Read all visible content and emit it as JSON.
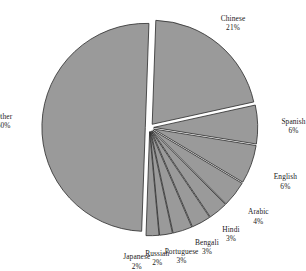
{
  "chart_data": {
    "type": "pie",
    "title": "",
    "subtitle": "",
    "xlabel": "",
    "ylabel": "",
    "legend_position": "none",
    "grid": false,
    "exploded": true,
    "fill_color": "#9a9a9a",
    "outline_color": "#2b2b2b",
    "background_color": "#ffffff",
    "units": "%",
    "categories": [
      "Chinese",
      "Spanish",
      "English",
      "Arabic",
      "Hindi",
      "Bengali",
      "Portuguese",
      "Russian",
      "Japanese",
      "Other"
    ],
    "values": [
      21,
      6,
      6,
      4,
      3,
      3,
      3,
      2,
      2,
      50
    ],
    "slices": [
      {
        "label": "Chinese",
        "value": 21,
        "value_text": "21%"
      },
      {
        "label": "Spanish",
        "value": 6,
        "value_text": "6%"
      },
      {
        "label": "English",
        "value": 6,
        "value_text": "6%"
      },
      {
        "label": "Arabic",
        "value": 4,
        "value_text": "4%"
      },
      {
        "label": "Hindi",
        "value": 3,
        "value_text": "3%"
      },
      {
        "label": "Bengali",
        "value": 3,
        "value_text": "3%"
      },
      {
        "label": "Portuguese",
        "value": 3,
        "value_text": "3%"
      },
      {
        "label": "Russian",
        "value": 2,
        "value_text": "2%"
      },
      {
        "label": "Japanese",
        "value": 2,
        "value_text": "2%"
      },
      {
        "label": "Other",
        "value": 50,
        "value_text": "50%"
      }
    ]
  }
}
